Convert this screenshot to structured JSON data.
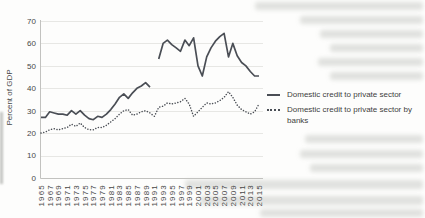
{
  "figure": {
    "ylabel": "Percent of GDP"
  },
  "chart_data": {
    "type": "line",
    "title": "",
    "xlabel": "",
    "ylabel": "Percent of GDP",
    "ylim": [
      0,
      70
    ],
    "yticks": [
      0,
      10,
      20,
      30,
      40,
      50,
      60,
      70
    ],
    "grid": true,
    "legend_position": "right",
    "x": [
      1965,
      1966,
      1967,
      1968,
      1969,
      1970,
      1971,
      1972,
      1973,
      1974,
      1975,
      1976,
      1977,
      1978,
      1979,
      1980,
      1981,
      1982,
      1983,
      1984,
      1985,
      1986,
      1987,
      1988,
      1989,
      1990,
      1991,
      1992,
      1993,
      1994,
      1995,
      1996,
      1997,
      1998,
      1999,
      2000,
      2001,
      2002,
      2003,
      2004,
      2005,
      2006,
      2007,
      2008,
      2009,
      2010,
      2011,
      2012,
      2013,
      2014,
      2015
    ],
    "x_tick_labels": [
      "1965",
      "1967",
      "1969",
      "1971",
      "1973",
      "1975",
      "1977",
      "1979",
      "1981",
      "1983",
      "1985",
      "1987",
      "1989",
      "1991",
      "1993",
      "1995",
      "1997",
      "1999",
      "2001",
      "2003",
      "2005",
      "2007",
      "2009",
      "2011",
      "2013",
      "2015"
    ],
    "series": [
      {
        "name": "Domestic credit to private sector",
        "style": "solid",
        "color": "#4a4e55",
        "values": [
          27,
          27,
          29.5,
          29,
          28.5,
          28.5,
          28,
          30,
          28.5,
          30,
          28,
          26.5,
          26,
          27.5,
          27,
          28.5,
          30.5,
          33,
          36,
          37.5,
          35.5,
          38,
          40,
          41,
          42.5,
          40.5,
          null,
          53,
          60,
          61.5,
          59.5,
          58,
          56.5,
          61.5,
          59,
          62.5,
          50,
          45.5,
          54,
          58,
          61,
          63,
          64.5,
          54,
          60,
          54.5,
          51.5,
          50,
          47.5,
          45.5,
          45.5
        ]
      },
      {
        "name": "Domestic credit to private sector by banks",
        "style": "dotted",
        "color": "#4a4e55",
        "values": [
          20,
          20.5,
          21.5,
          22,
          21.5,
          22,
          22.5,
          24,
          23,
          24.5,
          22.5,
          21.5,
          21.5,
          22.5,
          22.5,
          23.5,
          25,
          26.5,
          28.5,
          30,
          30.5,
          28,
          28.5,
          29.5,
          30,
          29,
          27.5,
          31.5,
          32,
          33.5,
          33,
          33.5,
          34,
          35.5,
          33,
          27.5,
          29.5,
          31.5,
          33.5,
          33,
          33.5,
          34.5,
          36,
          38.5,
          36,
          32.5,
          30.5,
          29.5,
          28.5,
          29.5,
          33
        ]
      }
    ]
  }
}
